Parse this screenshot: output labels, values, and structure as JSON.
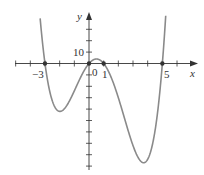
{
  "chart_data": {
    "type": "line",
    "title": "",
    "xlabel": "x",
    "ylabel": "y",
    "function_description": "Quartic polynomial with roots at x = -3, 0, 1, 5 (y = x(x+3)(x-1)(x-5))",
    "x_tick_labels": [
      "-3",
      "0",
      "1",
      "5"
    ],
    "y_tick_labels": [
      "10"
    ],
    "x_tick_step": 1,
    "y_tick_step": 10,
    "xlim": [
      -5,
      7
    ],
    "ylim": [
      -95,
      45
    ],
    "grid": false,
    "legend": null,
    "marked_points": [
      {
        "x": -3,
        "y": 0
      },
      {
        "x": 0,
        "y": 0
      },
      {
        "x": 1,
        "y": 0
      },
      {
        "x": 5,
        "y": 0
      }
    ],
    "series": [
      {
        "name": "f(x)",
        "x": [
          -3.5,
          -3,
          -2.5,
          -2,
          -1.5,
          -1,
          -0.5,
          0,
          0.5,
          1,
          1.5,
          2,
          2.5,
          3,
          3.5,
          3.7,
          4,
          4.5,
          5,
          5.4
        ],
        "values": [
          42.5,
          0,
          -26.9,
          -42,
          -40.2,
          -24,
          -6.9,
          0,
          3.9,
          0,
          -11.8,
          -30,
          -50.6,
          -72,
          -89.4,
          -87.2,
          -84,
          -56.3,
          0,
          66.5
        ]
      }
    ],
    "key_features": {
      "local_max": {
        "x": 0.5,
        "y": 3.9
      },
      "local_min_left": {
        "x": -2,
        "y": -42
      },
      "local_min_right": {
        "x": 3.7,
        "y": -87
      }
    }
  },
  "labels": {
    "x_axis": "x",
    "y_axis": "y",
    "ten": "10",
    "neg_three": "−3",
    "zero": "0",
    "one": "1",
    "five": "5"
  }
}
